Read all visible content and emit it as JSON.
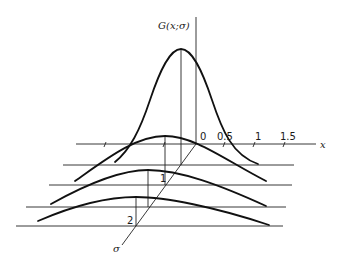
{
  "diagram": {
    "vertical_axis_label": "G(x;σ)",
    "x_axis_label": "x",
    "sigma_axis_label": "σ",
    "x_ticks": [
      "0",
      "0.5",
      "1",
      "1.5"
    ],
    "sigma_ticks": [
      "1",
      "2"
    ],
    "curves": [
      {
        "name": "sigma-0.25",
        "peak_height": "tallest"
      },
      {
        "name": "sigma-0.5"
      },
      {
        "name": "sigma-1"
      },
      {
        "name": "sigma-2"
      }
    ],
    "colors": {
      "line": "#111111",
      "background": "#ffffff"
    }
  }
}
